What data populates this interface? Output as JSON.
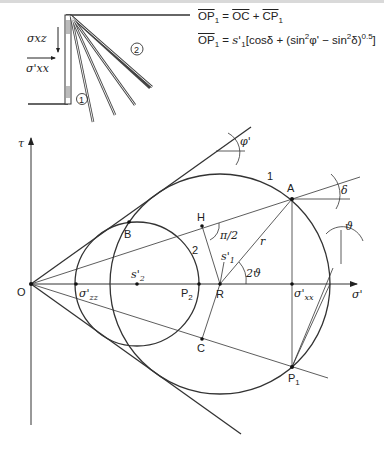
{
  "inset": {
    "stress_shear_label": "σxz",
    "stress_normal_label": "σ'xx",
    "zone_1": "1",
    "zone_2": "2"
  },
  "formulas": {
    "line1": {
      "lhs": "OP",
      "lhs_sub": "1",
      "eq": " = ",
      "t1": "OC",
      "plus": " + ",
      "t2": "CP",
      "t2_sub": "1"
    },
    "line2": {
      "lhs": "OP",
      "lhs_sub": "1",
      "eq": " = ",
      "coef": "s'",
      "coef_sub": "1",
      "body": "[cosδ + (sin",
      "sq1": "2",
      "phi": "φ' − sin",
      "sq2": "2",
      "tail": "δ)",
      "exp": "0.5",
      "close": "]"
    }
  },
  "mohr": {
    "axis_tau": "τ",
    "axis_sigma": "σ'",
    "origin": "O",
    "points": {
      "A": "A",
      "B": "B",
      "C": "C",
      "H": "H",
      "R": "R",
      "P1": "P",
      "P1_sub": "1",
      "P2": "P",
      "P2_sub": "2",
      "s2": "s'",
      "s2_sub": "2",
      "s1": "s'",
      "s1_sub": "1",
      "sigma_zz": "σ'",
      "sigma_zz_sub": "zz",
      "sigma_xx": "σ'",
      "sigma_xx_sub": "xx"
    },
    "circle_labels": {
      "big": "1",
      "small": "2"
    },
    "angles": {
      "phi": "φ'",
      "delta": "δ",
      "theta": "ϑ",
      "two_theta": "2ϑ",
      "right_angle": "π/2"
    },
    "radius_label": "r"
  }
}
